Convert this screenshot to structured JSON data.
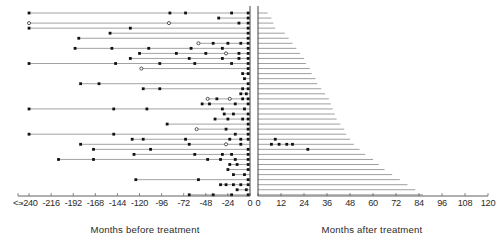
{
  "chart_data": {
    "type": "bar",
    "title": "",
    "subtitle": "",
    "orientation": "horizontal",
    "grid": false,
    "legend_position": "none",
    "panels": [
      {
        "name": "before",
        "xlabel": "Months before treatment",
        "xlim": [
          -252,
          0
        ],
        "direction": "left",
        "ticks": [
          -252,
          -240,
          -216,
          -192,
          -168,
          -144,
          -120,
          -96,
          -72,
          -48,
          -24,
          0
        ],
        "ticklabels": [
          "<=",
          "-240",
          "-216",
          "-192",
          "-168",
          "-144",
          "-120",
          "-96",
          "-72",
          "-48",
          "-24",
          "0"
        ]
      },
      {
        "name": "after",
        "xlabel": "Months after treatment",
        "xlim": [
          0,
          120
        ],
        "direction": "right",
        "ticks": [
          0,
          12,
          24,
          36,
          48,
          60,
          72,
          84,
          96,
          108,
          120
        ],
        "ticklabels": [
          "0",
          "12",
          "24",
          "36",
          "48",
          "60",
          "72",
          "84",
          "96",
          "108",
          "120"
        ]
      }
    ],
    "marker_types": {
      "filled": "filled-square-event",
      "open": "open-circle-event"
    },
    "rows": [
      {
        "start": -240,
        "events": [
          {
            "x": -240,
            "t": "filled"
          },
          {
            "x": -87,
            "t": "filled"
          },
          {
            "x": -70,
            "t": "filled"
          },
          {
            "x": -20,
            "t": "filled"
          },
          {
            "x": -2,
            "t": "filled"
          }
        ],
        "followup": 5
      },
      {
        "start": -34,
        "events": [
          {
            "x": -34,
            "t": "filled"
          },
          {
            "x": -2,
            "t": "filled"
          }
        ],
        "followup": 7
      },
      {
        "start": -240,
        "events": [
          {
            "x": -240,
            "t": "open"
          },
          {
            "x": -88,
            "t": "open"
          },
          {
            "x": -12,
            "t": "filled"
          },
          {
            "x": -2,
            "t": "filled"
          }
        ],
        "followup": 8
      },
      {
        "start": -240,
        "events": [
          {
            "x": -240,
            "t": "filled"
          },
          {
            "x": -130,
            "t": "filled"
          },
          {
            "x": -2,
            "t": "filled"
          }
        ],
        "followup": 9
      },
      {
        "start": -152,
        "events": [
          {
            "x": -152,
            "t": "filled"
          },
          {
            "x": -2,
            "t": "filled"
          }
        ],
        "followup": 14
      },
      {
        "start": -186,
        "events": [
          {
            "x": -186,
            "t": "filled"
          },
          {
            "x": -2,
            "t": "filled"
          }
        ],
        "followup": 16
      },
      {
        "start": -56,
        "events": [
          {
            "x": -56,
            "t": "open"
          },
          {
            "x": -40,
            "t": "filled"
          },
          {
            "x": -24,
            "t": "filled"
          },
          {
            "x": -10,
            "t": "filled"
          },
          {
            "x": -2,
            "t": "filled"
          }
        ],
        "followup": 18
      },
      {
        "start": -190,
        "events": [
          {
            "x": -190,
            "t": "filled"
          },
          {
            "x": -150,
            "t": "filled"
          },
          {
            "x": -110,
            "t": "filled"
          },
          {
            "x": -64,
            "t": "filled"
          },
          {
            "x": -30,
            "t": "filled"
          },
          {
            "x": -2,
            "t": "filled"
          }
        ],
        "followup": 20
      },
      {
        "start": -120,
        "events": [
          {
            "x": -120,
            "t": "filled"
          },
          {
            "x": -80,
            "t": "filled"
          },
          {
            "x": -48,
            "t": "filled"
          },
          {
            "x": -26,
            "t": "open"
          },
          {
            "x": -12,
            "t": "filled"
          },
          {
            "x": -2,
            "t": "filled"
          }
        ],
        "followup": 22
      },
      {
        "start": -130,
        "events": [
          {
            "x": -130,
            "t": "filled"
          },
          {
            "x": -66,
            "t": "filled"
          },
          {
            "x": -30,
            "t": "filled"
          },
          {
            "x": -12,
            "t": "filled"
          },
          {
            "x": -2,
            "t": "filled"
          }
        ],
        "followup": 24
      },
      {
        "start": -240,
        "events": [
          {
            "x": -240,
            "t": "filled"
          },
          {
            "x": -146,
            "t": "filled"
          },
          {
            "x": -98,
            "t": "filled"
          },
          {
            "x": -60,
            "t": "filled"
          },
          {
            "x": -20,
            "t": "filled"
          },
          {
            "x": -2,
            "t": "filled"
          }
        ],
        "followup": 25
      },
      {
        "start": -118,
        "events": [
          {
            "x": -118,
            "t": "open"
          },
          {
            "x": -2,
            "t": "filled"
          }
        ],
        "followup": 27
      },
      {
        "start": -8,
        "events": [
          {
            "x": -8,
            "t": "filled"
          },
          {
            "x": -2,
            "t": "filled"
          }
        ],
        "followup": 28
      },
      {
        "start": -6,
        "events": [
          {
            "x": -6,
            "t": "filled"
          }
        ],
        "followup": 30
      },
      {
        "start": -184,
        "events": [
          {
            "x": -184,
            "t": "filled"
          },
          {
            "x": -164,
            "t": "filled"
          },
          {
            "x": -2,
            "t": "filled"
          }
        ],
        "followup": 31
      },
      {
        "start": -116,
        "events": [
          {
            "x": -116,
            "t": "filled"
          },
          {
            "x": -98,
            "t": "filled"
          },
          {
            "x": -8,
            "t": "filled"
          },
          {
            "x": -2,
            "t": "filled"
          }
        ],
        "followup": 33
      },
      {
        "start": -10,
        "events": [
          {
            "x": -10,
            "t": "filled"
          },
          {
            "x": -4,
            "t": "filled"
          }
        ],
        "followup": 35
      },
      {
        "start": -46,
        "events": [
          {
            "x": -46,
            "t": "open"
          },
          {
            "x": -36,
            "t": "filled"
          },
          {
            "x": -22,
            "t": "open"
          },
          {
            "x": -8,
            "t": "filled"
          },
          {
            "x": -2,
            "t": "filled"
          }
        ],
        "followup": 37
      },
      {
        "start": -52,
        "events": [
          {
            "x": -52,
            "t": "filled"
          },
          {
            "x": -44,
            "t": "filled"
          },
          {
            "x": -16,
            "t": "filled"
          },
          {
            "x": -2,
            "t": "filled"
          }
        ],
        "followup": 38
      },
      {
        "start": -240,
        "events": [
          {
            "x": -240,
            "t": "filled"
          },
          {
            "x": -148,
            "t": "filled"
          },
          {
            "x": -112,
            "t": "filled"
          },
          {
            "x": -30,
            "t": "filled"
          },
          {
            "x": -6,
            "t": "filled"
          }
        ],
        "followup": 39
      },
      {
        "start": -28,
        "events": [
          {
            "x": -28,
            "t": "filled"
          },
          {
            "x": -18,
            "t": "filled"
          },
          {
            "x": -2,
            "t": "filled"
          }
        ],
        "followup": 40
      },
      {
        "start": -38,
        "events": [
          {
            "x": -38,
            "t": "filled"
          },
          {
            "x": -24,
            "t": "filled"
          },
          {
            "x": -8,
            "t": "filled"
          },
          {
            "x": -2,
            "t": "filled"
          }
        ],
        "followup": 41
      },
      {
        "start": -90,
        "events": [
          {
            "x": -90,
            "t": "filled"
          },
          {
            "x": -2,
            "t": "filled"
          }
        ],
        "followup": 43
      },
      {
        "start": -58,
        "events": [
          {
            "x": -58,
            "t": "open"
          },
          {
            "x": -26,
            "t": "filled"
          },
          {
            "x": -2,
            "t": "filled"
          }
        ],
        "followup": 45
      },
      {
        "start": -240,
        "events": [
          {
            "x": -240,
            "t": "filled"
          },
          {
            "x": -148,
            "t": "filled"
          },
          {
            "x": -16,
            "t": "filled"
          },
          {
            "x": -2,
            "t": "filled"
          }
        ],
        "followup": 46
      },
      {
        "start": -128,
        "events": [
          {
            "x": -128,
            "t": "filled"
          },
          {
            "x": -116,
            "t": "filled"
          },
          {
            "x": -70,
            "t": "filled"
          },
          {
            "x": -22,
            "t": "filled"
          },
          {
            "x": -10,
            "t": "filled"
          },
          {
            "x": -2,
            "t": "filled"
          }
        ],
        "followup": 48,
        "right_events": [
          {
            "x": 9,
            "t": "filled"
          }
        ]
      },
      {
        "start": -184,
        "events": [
          {
            "x": -184,
            "t": "filled"
          },
          {
            "x": -66,
            "t": "filled"
          },
          {
            "x": -26,
            "t": "open"
          },
          {
            "x": -10,
            "t": "filled"
          }
        ],
        "followup": 50,
        "right_events": [
          {
            "x": 7,
            "t": "filled"
          },
          {
            "x": 11,
            "t": "filled"
          },
          {
            "x": 15,
            "t": "filled"
          },
          {
            "x": 18,
            "t": "filled"
          }
        ]
      },
      {
        "start": -170,
        "events": [
          {
            "x": -170,
            "t": "filled"
          },
          {
            "x": -108,
            "t": "filled"
          },
          {
            "x": -2,
            "t": "filled"
          }
        ],
        "followup": 53,
        "right_events": [
          {
            "x": 26,
            "t": "filled"
          }
        ]
      },
      {
        "start": -126,
        "events": [
          {
            "x": -126,
            "t": "filled"
          },
          {
            "x": -60,
            "t": "filled"
          },
          {
            "x": -30,
            "t": "filled"
          },
          {
            "x": -20,
            "t": "filled"
          },
          {
            "x": -2,
            "t": "filled"
          }
        ],
        "followup": 56
      },
      {
        "start": -208,
        "events": [
          {
            "x": -208,
            "t": "filled"
          },
          {
            "x": -170,
            "t": "filled"
          },
          {
            "x": -46,
            "t": "filled"
          },
          {
            "x": -32,
            "t": "filled"
          },
          {
            "x": -16,
            "t": "filled"
          },
          {
            "x": -2,
            "t": "filled"
          }
        ],
        "followup": 60
      },
      {
        "start": -22,
        "events": [
          {
            "x": -22,
            "t": "filled"
          },
          {
            "x": -14,
            "t": "filled"
          },
          {
            "x": -2,
            "t": "filled"
          }
        ],
        "followup": 63
      },
      {
        "start": -24,
        "events": [
          {
            "x": -24,
            "t": "filled"
          },
          {
            "x": -2,
            "t": "filled"
          }
        ],
        "followup": 66
      },
      {
        "start": -18,
        "events": [
          {
            "x": -18,
            "t": "filled"
          },
          {
            "x": -6,
            "t": "filled"
          }
        ],
        "followup": 70
      },
      {
        "start": -124,
        "events": [
          {
            "x": -124,
            "t": "filled"
          },
          {
            "x": -56,
            "t": "filled"
          },
          {
            "x": -2,
            "t": "filled"
          }
        ],
        "followup": 74
      },
      {
        "start": -32,
        "events": [
          {
            "x": -32,
            "t": "filled"
          },
          {
            "x": -26,
            "t": "filled"
          },
          {
            "x": -18,
            "t": "filled"
          },
          {
            "x": -10,
            "t": "filled"
          },
          {
            "x": -2,
            "t": "filled"
          }
        ],
        "followup": 78
      },
      {
        "start": -14,
        "events": [
          {
            "x": -14,
            "t": "filled"
          },
          {
            "x": -4,
            "t": "filled"
          }
        ],
        "followup": 82
      },
      {
        "start": -66,
        "events": [
          {
            "x": -66,
            "t": "filled"
          },
          {
            "x": -40,
            "t": "filled"
          },
          {
            "x": -20,
            "t": "filled"
          },
          {
            "x": -2,
            "t": "filled"
          }
        ],
        "followup": 86
      }
    ]
  },
  "colors": {
    "axis": "#3a3a3a",
    "line": "#555555",
    "marker": "#111111",
    "background": "#ffffff"
  }
}
